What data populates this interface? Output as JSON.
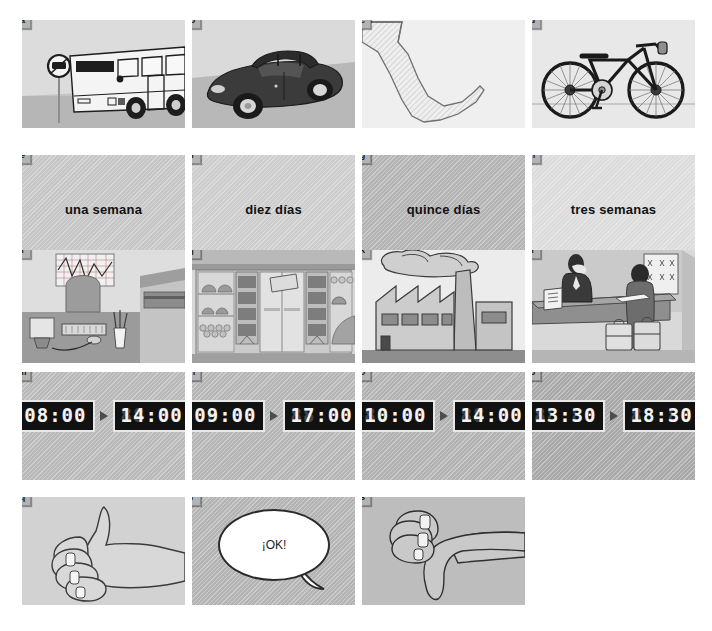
{
  "document": {
    "title": "Picture exercise sheet",
    "language": "Spanish",
    "layout": {
      "columns": 4,
      "rows": 5,
      "panel_width": 163,
      "panel_height": 108
    }
  },
  "rows": [
    {
      "row_name": "transport-row",
      "panels": [
        {
          "label": "a",
          "kind": "illustration",
          "subject": "bus-at-bus-stop",
          "bg": "#d4d4d4",
          "caption": ""
        },
        {
          "label": "b",
          "kind": "illustration",
          "subject": "convertible-car",
          "bg": "#d0d0d0",
          "caption": ""
        },
        {
          "label": "c",
          "kind": "illustration",
          "subject": "leg-and-foot-walking",
          "bg": "#ededed",
          "caption": ""
        },
        {
          "label": "d",
          "kind": "illustration",
          "subject": "bicycle",
          "bg": "#e3e3e3",
          "caption": ""
        }
      ]
    },
    {
      "row_name": "duration-row",
      "panels": [
        {
          "label": "e",
          "kind": "text",
          "subject": "duration-one-week",
          "bg": "#c6c6c6",
          "caption": "una semana"
        },
        {
          "label": "f",
          "kind": "text",
          "subject": "duration-ten-days",
          "bg": "#cdcdcd",
          "caption": "diez días"
        },
        {
          "label": "g",
          "kind": "text",
          "subject": "duration-fifteen-days",
          "bg": "#b4b4b4",
          "caption": "quince días"
        },
        {
          "label": "h",
          "kind": "text",
          "subject": "duration-three-weeks",
          "bg": "#dcdcdc",
          "caption": "tres semanas"
        }
      ]
    },
    {
      "row_name": "workplace-row",
      "panels": [
        {
          "label": "i",
          "kind": "illustration",
          "subject": "office-desk-with-computer",
          "bg": "#d6d6d6",
          "caption": ""
        },
        {
          "label": "j",
          "kind": "illustration",
          "subject": "shop-storefront-market",
          "bg": "#cfcfcf",
          "caption": ""
        },
        {
          "label": "k",
          "kind": "illustration",
          "subject": "factory-with-smokestack",
          "bg": "#e8e8e8",
          "caption": ""
        },
        {
          "label": "l",
          "kind": "illustration",
          "subject": "hotel-reception-desk",
          "bg": "#d2d2d2",
          "caption": ""
        }
      ]
    },
    {
      "row_name": "schedule-row",
      "panels": [
        {
          "label": "m",
          "kind": "clock",
          "subject": "schedule-08-to-14",
          "bg": "#b9b9b9",
          "start_time": "08:00",
          "end_time": "14:00"
        },
        {
          "label": "n",
          "kind": "clock",
          "subject": "schedule-09-to-17",
          "bg": "#b6b6b6",
          "start_time": "09:00",
          "end_time": "17:00"
        },
        {
          "label": "o",
          "kind": "clock",
          "subject": "schedule-10-to-14",
          "bg": "#b2b2b2",
          "start_time": "10:00",
          "end_time": "14:00"
        },
        {
          "label": "p",
          "kind": "clock",
          "subject": "schedule-1330-to-1830",
          "bg": "#a9a9a9",
          "start_time": "13:30",
          "end_time": "18:30"
        }
      ]
    },
    {
      "row_name": "response-row",
      "panels": [
        {
          "label": "q",
          "kind": "illustration",
          "subject": "thumbs-up-hand",
          "bg": "#cdcdcd",
          "caption": ""
        },
        {
          "label": "r",
          "kind": "speech",
          "subject": "speech-bubble-ok",
          "bg": "#b4b4b4",
          "caption": "¡OK!"
        },
        {
          "label": "s",
          "kind": "illustration",
          "subject": "thumbs-down-hand",
          "bg": "#b9b9b9",
          "caption": ""
        }
      ]
    }
  ],
  "colors": {
    "page_background": "#ffffff",
    "badge_background": "#b3b3b3",
    "badge_text": "#1a1a1a",
    "lcd_background": "#111111",
    "lcd_text": "#f2f2f2",
    "lcd_frame": "#e8e8e8",
    "arrow": "#4d4d4d",
    "ink": "#2b2b2b"
  }
}
